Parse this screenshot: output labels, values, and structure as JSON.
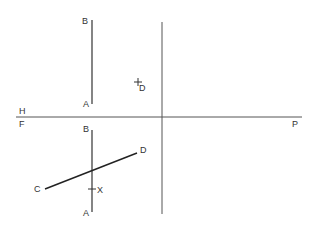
{
  "diagram": {
    "type": "orthographic-projection",
    "colors": {
      "background": "#ffffff",
      "line": "#333333",
      "reference_line": "#555555"
    },
    "reference_lines": {
      "horizontal_fold": {
        "upper_label": "H",
        "lower_label": "F",
        "end_label": "P"
      }
    },
    "top_view": {
      "line_AB": {
        "label_start": "A",
        "label_end": "B"
      },
      "point_D": {
        "label": "D",
        "marker": "plus"
      }
    },
    "front_view": {
      "line_AB": {
        "label_start": "A",
        "label_end": "B"
      },
      "line_CD": {
        "label_start": "C",
        "label_end": "D"
      },
      "point_X": {
        "label": "X",
        "marker": "tick"
      }
    }
  }
}
